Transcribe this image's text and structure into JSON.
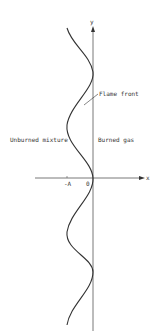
{
  "diagram": {
    "axis_labels": {
      "x": "x",
      "y": "y"
    },
    "tick_labels": {
      "neg_a": "-A",
      "zero": "0"
    },
    "annotations": {
      "flame_front": "Flame front",
      "left_region": "Unburned mixture",
      "right_region": "Burned gas"
    },
    "colors": {
      "line": "#333333",
      "axis": "#555555",
      "background": "#ffffff"
    }
  }
}
